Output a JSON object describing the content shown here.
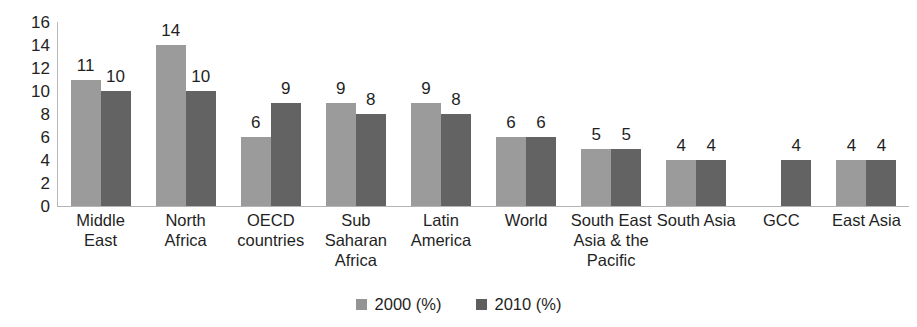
{
  "chart_data": {
    "type": "bar",
    "title": "",
    "subtitle": "",
    "xlabel": "",
    "ylabel": "",
    "ylim": [
      0,
      16
    ],
    "ytick_step": 2,
    "yticks": [
      16,
      14,
      12,
      10,
      8,
      6,
      4,
      2,
      0
    ],
    "grid": false,
    "legend_position": "bottom-center",
    "categories": [
      "Middle East",
      "North Africa",
      "OECD countries",
      "Sub Saharan Africa",
      "Latin America",
      "World",
      "South East Asia & the Pacific",
      "South Asia",
      "GCC",
      "East Asia"
    ],
    "category_lines": [
      [
        "Middle",
        "East"
      ],
      [
        "North",
        "Africa"
      ],
      [
        "OECD",
        "countries"
      ],
      [
        "Sub",
        "Saharan",
        "Africa"
      ],
      [
        "Latin",
        "America"
      ],
      [
        "World"
      ],
      [
        "South East",
        "Asia & the",
        "Pacific"
      ],
      [
        "South Asia"
      ],
      [
        "GCC"
      ],
      [
        "East Asia"
      ]
    ],
    "series": [
      {
        "name": "2000 (%)",
        "color": "#9b9b9b",
        "values": [
          11,
          14,
          6,
          9,
          9,
          6,
          5,
          4,
          null,
          4
        ]
      },
      {
        "name": "2010 (%)",
        "color": "#636363",
        "values": [
          10,
          10,
          9,
          8,
          8,
          6,
          5,
          4,
          4,
          4
        ]
      }
    ],
    "data_labels": [
      [
        "11",
        "10"
      ],
      [
        "14",
        "10"
      ],
      [
        "6",
        "9"
      ],
      [
        "9",
        "8"
      ],
      [
        "9",
        "8"
      ],
      [
        "6",
        "6"
      ],
      [
        "5",
        "5"
      ],
      [
        "4",
        "4"
      ],
      [
        "",
        "4"
      ],
      [
        "4",
        "4"
      ]
    ]
  },
  "legend": {
    "items": [
      {
        "label": "2000 (%)",
        "color": "#9b9b9b"
      },
      {
        "label": "2010 (%)",
        "color": "#636363"
      }
    ]
  },
  "axis": {
    "y_labels": [
      "16",
      "14",
      "12",
      "10",
      "8",
      "6",
      "4",
      "2",
      "0"
    ]
  }
}
